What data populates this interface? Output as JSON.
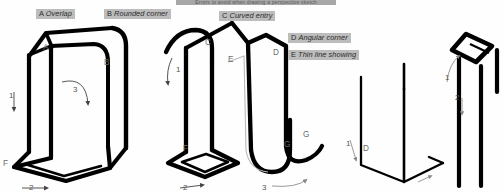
{
  "page": {
    "background_color": "#ffffff",
    "ink_color": "#000000",
    "chip_color": "#bdbdbd",
    "thin_line_color": "#b9b9b9"
  },
  "top_strip": {
    "text": "Errors to avoid when drawing a perspective sketch",
    "visible": "partially cropped"
  },
  "callouts": [
    {
      "letter": "A",
      "name": "Overlap",
      "x": 36,
      "y": 9
    },
    {
      "letter": "B",
      "name": "Rounded corner",
      "x": 104,
      "y": 9
    },
    {
      "letter": "C",
      "name": "Curved entry",
      "x": 219,
      "y": 11
    },
    {
      "letter": "D",
      "name": "Angular corner",
      "x": 288,
      "y": 33
    },
    {
      "letter": "E",
      "name": "Thin line showing",
      "x": 288,
      "y": 50
    }
  ],
  "figures": [
    {
      "id": "figure-1",
      "name": "overlap-and-rounded-corner-box",
      "style": "thick-ink",
      "point_labels": [
        {
          "text": "A",
          "x": 43,
          "y": 46
        },
        {
          "text": "B",
          "x": 104,
          "y": 62
        },
        {
          "text": "F",
          "x": 4,
          "y": 162
        }
      ],
      "stroke_arrows": [
        {
          "number": "1",
          "direction": "down",
          "x": 13,
          "y": 100
        },
        {
          "number": "2",
          "direction": "right",
          "x": 33,
          "y": 184
        },
        {
          "number": "3",
          "direction": "curve-down-right",
          "x": 78,
          "y": 92
        }
      ]
    },
    {
      "id": "figure-2",
      "name": "curved-entry-wave-form",
      "style": "thick-ink",
      "point_labels": [
        {
          "text": "C",
          "x": 206,
          "y": 42
        },
        {
          "text": "D",
          "x": 273,
          "y": 52
        },
        {
          "text": "E",
          "x": 229,
          "y": 60
        },
        {
          "text": "F",
          "x": 184,
          "y": 147
        },
        {
          "text": "G",
          "x": 286,
          "y": 143
        },
        {
          "text": "G",
          "x": 303,
          "y": 134
        }
      ],
      "stroke_arrows": [
        {
          "number": "1",
          "direction": "down",
          "x": 182,
          "y": 73
        },
        {
          "number": "2",
          "direction": "right",
          "x": 190,
          "y": 185
        },
        {
          "number": "3",
          "direction": "right",
          "x": 262,
          "y": 183
        }
      ]
    },
    {
      "id": "figure-3",
      "name": "thin-line-L-bracket",
      "style": "thin-ink",
      "point_labels": [
        {
          "text": "D",
          "x": 364,
          "y": 147
        }
      ],
      "stroke_arrows": [
        {
          "number": "1",
          "direction": "down-left",
          "x": 351,
          "y": 150
        }
      ]
    },
    {
      "id": "figure-4",
      "name": "table-top-with-legs",
      "style": "thick-ink",
      "point_labels": [],
      "stroke_arrows": [
        {
          "number": "1",
          "direction": "up",
          "x": 452,
          "y": 72
        },
        {
          "number": "2",
          "direction": "down",
          "x": 458,
          "y": 105
        }
      ]
    }
  ]
}
